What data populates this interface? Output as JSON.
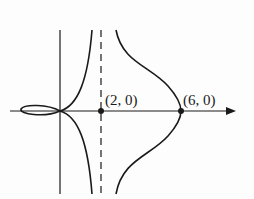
{
  "figure": {
    "type": "curve-sketch",
    "points": [
      {
        "label": "(2, 0)",
        "x": 2,
        "y": 0
      },
      {
        "label": "(6, 0)",
        "x": 6,
        "y": 0
      }
    ],
    "asymptote": {
      "type": "vertical",
      "x": 2,
      "style": "dashed"
    },
    "features": [
      "loop left of origin",
      "branches approaching asymptote x=2",
      "branch through (6, 0) symmetric about x-axis"
    ],
    "colors": {
      "stroke": "#1a1a1a",
      "background": "#fdfdfd"
    }
  }
}
